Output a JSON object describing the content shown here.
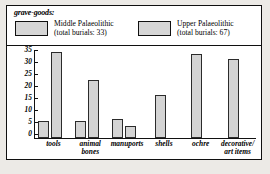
{
  "legend": {
    "title": "grave-goods:",
    "entries": [
      {
        "label": "Middle Palaeolithic",
        "sub": "(total burials: 33)",
        "color": "#d6d6d6"
      },
      {
        "label": "Upper Palaeolithic",
        "sub": "(total burials: 67)",
        "color": "#d6d6d6"
      }
    ]
  },
  "chart_data": {
    "type": "bar",
    "title": "grave-goods:",
    "xlabel": "",
    "ylabel": "",
    "ylim": [
      0,
      35
    ],
    "yticks": [
      0,
      5,
      10,
      15,
      20,
      25,
      30,
      35
    ],
    "grid": false,
    "legend_position": "top",
    "categories": [
      "tools",
      "animal bones",
      "manuports",
      "shells",
      "ochre",
      "decorative/ art items"
    ],
    "series": [
      {
        "name": "Middle Palaeolithic",
        "values": [
          7,
          7,
          8,
          0,
          0,
          0
        ]
      },
      {
        "name": "Upper Palaeolithic",
        "values": [
          36,
          24,
          5,
          18,
          35,
          33
        ]
      }
    ]
  }
}
